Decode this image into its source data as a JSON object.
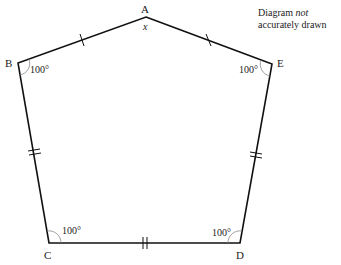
{
  "note": {
    "line1_prefix": "Diagram ",
    "line1_em": "not",
    "line2": "accurately drawn"
  },
  "vertices": {
    "A": {
      "label": "A",
      "x": 146,
      "y": 17
    },
    "B": {
      "label": "B",
      "x": 18,
      "y": 63
    },
    "C": {
      "label": "C",
      "x": 49,
      "y": 243
    },
    "D": {
      "label": "D",
      "x": 240,
      "y": 243
    },
    "E": {
      "label": "E",
      "x": 272,
      "y": 64
    }
  },
  "angles": {
    "A": "x",
    "B": "100°",
    "C": "100°",
    "D": "100°",
    "E": "100°"
  },
  "colors": {
    "stroke": "#111111",
    "text": "#222222"
  }
}
